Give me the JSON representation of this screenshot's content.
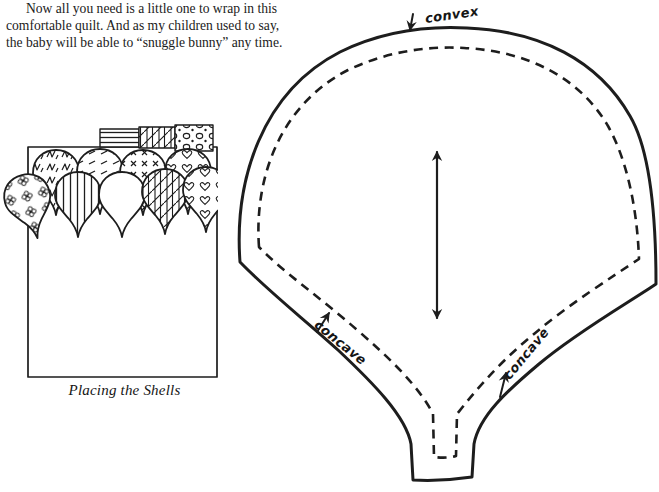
{
  "colors": {
    "background": "#ffffff",
    "ink": "#1d1d1d"
  },
  "paragraph": {
    "lines": [
      "Now all you need is a little one to wrap in this",
      "comfortable quilt. And as my children used to say,",
      "the baby will be able to “snuggle bunny” any time."
    ]
  },
  "placing_shells_figure": {
    "caption": "Placing the Shells"
  },
  "template_figure": {
    "convex_label": "convex",
    "concave_left_label": "concave",
    "concave_right_label": "concave"
  }
}
